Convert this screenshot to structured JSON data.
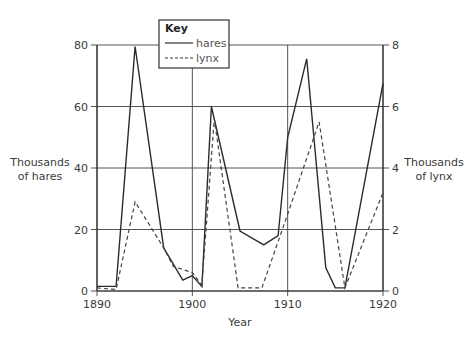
{
  "chart_data": {
    "type": "line",
    "title": "",
    "xlabel": "Year",
    "ylabel": "Thousands of hares",
    "ylabel_lines": [
      "Thousands",
      "of hares"
    ],
    "y2label": "Thousands of lynx",
    "y2label_lines": [
      "Thousands",
      "of lynx"
    ],
    "xlim": [
      1890,
      1920
    ],
    "ylim": [
      0,
      80
    ],
    "y2lim": [
      0,
      8
    ],
    "x_ticks": [
      1890,
      1900,
      1910,
      1920
    ],
    "y_ticks": [
      0,
      20,
      40,
      60,
      80
    ],
    "y2_ticks": [
      0,
      2,
      4,
      6,
      8
    ],
    "grid": true,
    "legend": {
      "title": "Key",
      "position": "top-center",
      "entries": [
        {
          "label": "hares",
          "style": "solid"
        },
        {
          "label": "lynx",
          "style": "dashed"
        }
      ]
    },
    "series": [
      {
        "name": "hares",
        "axis": "left",
        "style": "solid",
        "x": [
          1890,
          1892,
          1894,
          1897,
          1899,
          1900,
          1901,
          1902,
          1905,
          1907.5,
          1909,
          1910,
          1912,
          1914,
          1915,
          1916,
          1920
        ],
        "values": [
          1.5,
          1.5,
          79.5,
          14,
          3.5,
          5,
          1.5,
          60,
          19.5,
          15,
          18,
          50,
          75.5,
          7.5,
          1,
          1,
          67.5
        ]
      },
      {
        "name": "lynx",
        "axis": "right",
        "style": "dashed",
        "x": [
          1890,
          1892,
          1894,
          1897,
          1898,
          1900,
          1901,
          1902.3,
          1904.8,
          1907.3,
          1910,
          1913.3,
          1916,
          1920
        ],
        "values": [
          0.1,
          0.05,
          2.9,
          1.4,
          0.8,
          0.6,
          0.2,
          5.6,
          0.1,
          0.1,
          2.5,
          5.5,
          0.1,
          3.2
        ]
      }
    ]
  },
  "colors": {
    "line": "#2b2b2b",
    "grid": "#555555",
    "text": "#3a3a3a"
  }
}
